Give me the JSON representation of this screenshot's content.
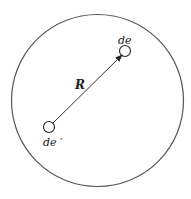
{
  "diagram": {
    "outer_circle": {
      "cx": 97.5,
      "cy": 100.5,
      "r": 86,
      "stroke": "#555555"
    },
    "element_de": {
      "label": "de",
      "cx": 125,
      "cy": 51,
      "r": 5.5
    },
    "element_de_prime": {
      "label": "de ′",
      "cx": 49,
      "cy": 127,
      "r": 5.5
    },
    "vector": {
      "label": "R",
      "from": "de′",
      "to": "de"
    }
  }
}
